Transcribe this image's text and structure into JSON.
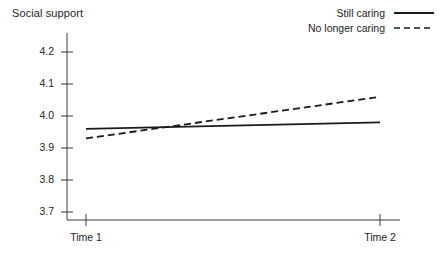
{
  "chart_data": {
    "type": "line",
    "title": "",
    "ylabel": "Social support",
    "xlabel": "",
    "x": [
      "Time 1",
      "Time 2"
    ],
    "categories": [
      "Time 1",
      "Time 2"
    ],
    "ylim": [
      3.65,
      4.25
    ],
    "yticks": [
      "4.2",
      "4.1",
      "4.0",
      "3.9",
      "3.8",
      "3.7"
    ],
    "ytick_values": [
      4.2,
      4.1,
      4.0,
      3.9,
      3.8,
      3.7
    ],
    "grid": false,
    "legend_position": "top-right",
    "series": [
      {
        "name": "Still caring",
        "style": "solid",
        "color": "#1a1a1a",
        "values": [
          3.96,
          3.98
        ]
      },
      {
        "name": "No longer caring",
        "style": "dashed",
        "color": "#1a1a1a",
        "values": [
          3.93,
          4.06
        ]
      }
    ]
  },
  "legend": {
    "items": [
      {
        "label": "Still caring",
        "style": "solid"
      },
      {
        "label": "No longer caring",
        "style": "dashed"
      }
    ]
  },
  "axes": {
    "y_label": "Social support",
    "y_ticks": [
      "4.2",
      "4.1",
      "4.0",
      "3.9",
      "3.8",
      "3.7"
    ],
    "x_ticks": [
      "Time 1",
      "Time 2"
    ]
  }
}
